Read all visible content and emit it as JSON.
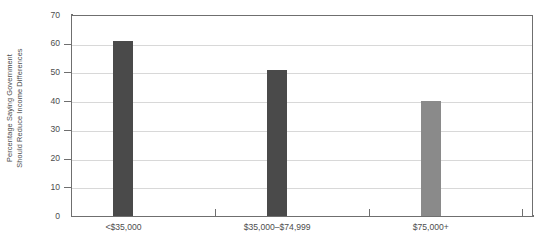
{
  "chart_data": {
    "type": "bar",
    "title": "",
    "subtitle": "",
    "xlabel": "",
    "ylabel": "Percentage Saying Government Should Reduce Income Differences",
    "ylabel_lines": [
      "Percentage Saying Government",
      "Should Reduce Income Differences"
    ],
    "categories": [
      "<$35,000",
      "$35,000–$74,999",
      "$75,000+"
    ],
    "values": [
      61,
      51,
      40
    ],
    "bar_colors": [
      "#4a4a4a",
      "#4a4a4a",
      "#8a8a8a"
    ],
    "ylim": [
      0,
      70
    ],
    "ytick_values": [
      0,
      10,
      20,
      30,
      40,
      50,
      60,
      70
    ],
    "ytick_labels": [
      "0",
      "10",
      "20",
      "30",
      "40",
      "50",
      "60",
      "70"
    ],
    "grid": true,
    "grid_axis": "y",
    "legend": false,
    "legend_position": "none",
    "background_color": "#ffffff",
    "axis_color": "#6f6f6f",
    "grid_color": "#d8d8d8",
    "text_color": "#4d4d4d"
  }
}
